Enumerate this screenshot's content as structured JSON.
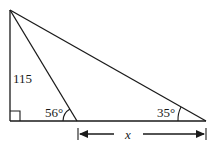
{
  "diagram": {
    "type": "geometry-triangle",
    "labels": {
      "side_height": "115",
      "angle_inner": "56°",
      "angle_right": "35°",
      "unknown": "x"
    },
    "points": {
      "top": [
        10,
        10
      ],
      "bottom_left": [
        10,
        121
      ],
      "inner_base": [
        77,
        121
      ],
      "bottom_right": [
        206,
        121
      ]
    },
    "colors": {
      "stroke": "#1a1a1a",
      "background": "#ffffff"
    }
  }
}
